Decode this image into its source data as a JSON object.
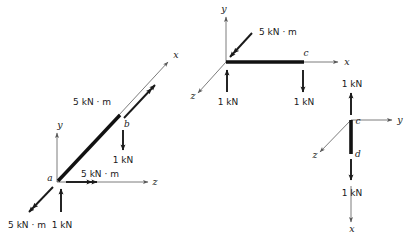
{
  "figure": {
    "colors": {
      "member": "#111111",
      "force_arrow": "#1a1a1a",
      "axis": "#5a5a5a",
      "text": "#1a1a1a",
      "background": "#ffffff"
    },
    "units": {
      "force": "kN",
      "moment": "kN·m"
    }
  },
  "diagrams": [
    {
      "id": "segment-ab",
      "name": "left-diagram",
      "members": [
        {
          "name": "member-ab",
          "from": "a",
          "to": "b"
        }
      ],
      "points": [
        {
          "name": "point-a",
          "label": "a"
        },
        {
          "name": "point-b",
          "label": "b"
        }
      ],
      "axes": [
        {
          "name": "axis-x",
          "label": "x",
          "direction": "up-right"
        },
        {
          "name": "axis-y",
          "label": "y",
          "direction": "up"
        },
        {
          "name": "axis-z",
          "label": "z",
          "direction": "right"
        }
      ],
      "loads": [
        {
          "name": "moment-at-b-along-x",
          "label": "5 kN · m",
          "kind": "moment",
          "direction": "up-right"
        },
        {
          "name": "force-at-b-down",
          "label": "1 kN",
          "kind": "force",
          "direction": "down"
        },
        {
          "name": "moment-at-a-along-z",
          "label": "5 kN · m",
          "kind": "moment",
          "direction": "right"
        },
        {
          "name": "moment-at-a-along-neg-x",
          "label": "5 kN · m",
          "kind": "moment",
          "direction": "down-left"
        },
        {
          "name": "force-at-a-up",
          "label": "1 kN",
          "kind": "force",
          "direction": "up"
        }
      ]
    },
    {
      "id": "segment-bc",
      "name": "middle-diagram",
      "members": [
        {
          "name": "member-bc",
          "from": "b",
          "to": "c"
        }
      ],
      "points": [
        {
          "name": "point-c",
          "label": "c"
        }
      ],
      "axes": [
        {
          "name": "axis-y",
          "label": "y",
          "direction": "up"
        },
        {
          "name": "axis-x",
          "label": "x",
          "direction": "right"
        },
        {
          "name": "axis-z",
          "label": "z",
          "direction": "down-left"
        }
      ],
      "loads": [
        {
          "name": "moment-at-b-along-neg-x",
          "label": "5 kN · m",
          "kind": "moment",
          "direction": "down-left"
        },
        {
          "name": "force-at-b-up",
          "label": "1 kN",
          "kind": "force",
          "direction": "up"
        },
        {
          "name": "force-at-c-down",
          "label": "1 kN",
          "kind": "force",
          "direction": "down"
        }
      ]
    },
    {
      "id": "segment-cd",
      "name": "right-diagram",
      "members": [
        {
          "name": "member-cd",
          "from": "c",
          "to": "d"
        }
      ],
      "points": [
        {
          "name": "point-c",
          "label": "c"
        },
        {
          "name": "point-d",
          "label": "d"
        }
      ],
      "axes": [
        {
          "name": "axis-y",
          "label": "y",
          "direction": "right"
        },
        {
          "name": "axis-z",
          "label": "z",
          "direction": "down-left"
        },
        {
          "name": "axis-x",
          "label": "x",
          "direction": "down"
        }
      ],
      "loads": [
        {
          "name": "force-at-c-up",
          "label": "1 kN",
          "kind": "force",
          "direction": "up"
        },
        {
          "name": "force-at-d-down",
          "label": "1 kN",
          "kind": "force",
          "direction": "down"
        }
      ]
    }
  ]
}
